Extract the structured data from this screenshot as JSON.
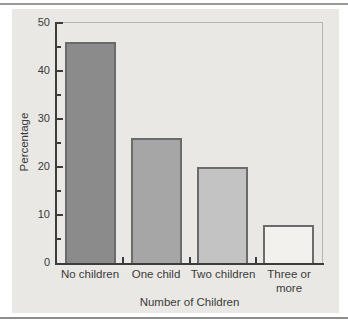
{
  "chart_data": {
    "type": "bar",
    "title": "",
    "categories": [
      "No children",
      "One child",
      "Two children",
      "Three or more"
    ],
    "values": [
      46,
      26,
      20,
      8
    ],
    "xlabel": "Number of Children",
    "ylabel": "Percentage",
    "ylim": [
      0,
      50
    ],
    "ytick_interval_major": 10,
    "ytick_interval_minor": 5,
    "ytick_labels_top_to_bottom": [
      "50",
      "40",
      "30",
      "20",
      "10",
      "0"
    ],
    "grid": false,
    "legend": "none",
    "bar_colors": [
      "#8b8b8b",
      "#a6a6a6",
      "#c3c3c3",
      "#f2f1ee"
    ],
    "bar_border_color": "#6b6b6b"
  },
  "page": {
    "background": "#ffffff",
    "panel_background": "#e9e8e4",
    "rule_color": "#989898",
    "axis_color": "#3c3c3c",
    "frame_color": "#b5b4b0"
  }
}
